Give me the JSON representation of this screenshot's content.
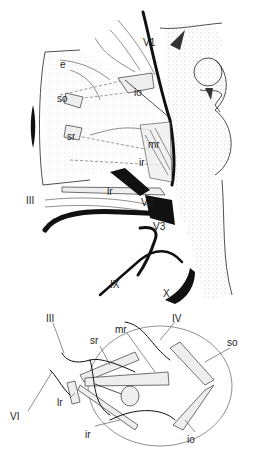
{
  "figure": {
    "upper_panel": {
      "description": "Lateral view of orbit with extraocular muscles and cranial nerves",
      "labels": {
        "v1": "V1",
        "e": "e",
        "so": "so",
        "io": "io",
        "sr": "sr",
        "mr": "mr",
        "ir": "ir",
        "lr": "lr",
        "iii": "III",
        "v2": "V2",
        "v3": "V3",
        "ix": "IX",
        "x": "X"
      }
    },
    "lower_panel": {
      "description": "Schematic of eye globe with extraocular muscles and innervation",
      "labels": {
        "iii": "III",
        "iv": "IV",
        "mr": "mr",
        "sr": "sr",
        "so": "so",
        "vi": "VI",
        "lr": "lr",
        "ir": "ir",
        "io": "io"
      }
    }
  }
}
